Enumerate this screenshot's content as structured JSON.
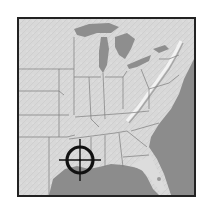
{
  "map": {
    "region": "Eastern United States",
    "style": "grayscale shaded relief",
    "colors": {
      "land": "#d6d6d6",
      "land_light": "#e4e4e4",
      "water": "#8a8a8a",
      "borders": "#7a7a7a",
      "frame": "#222222",
      "marker": "#111111"
    },
    "marker": {
      "type": "crosshair-target",
      "location": "Louisiana coast",
      "cx": 61,
      "cy": 141,
      "ring_radius": 13
    }
  }
}
